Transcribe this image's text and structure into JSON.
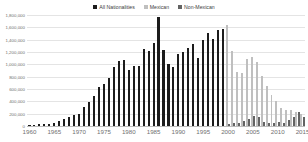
{
  "legend": {
    "position": "top-center",
    "items": [
      {
        "label": "All Nationalities",
        "color": "#1c1c1c",
        "icon": "square-marker-icon"
      },
      {
        "label": "Mexican",
        "color": "#bfbfbf",
        "icon": "square-marker-icon"
      },
      {
        "label": "Non-Mexican",
        "color": "#636363",
        "icon": "square-marker-icon"
      }
    ]
  },
  "axes": {
    "y_ticks": [
      "0",
      "200,000",
      "400,000",
      "600,000",
      "800,000",
      "1,000,000",
      "1,200,000",
      "1,400,000",
      "1,600,000",
      "1,800,000"
    ],
    "x_ticks": [
      "1960",
      "1965",
      "1970",
      "1975",
      "1980",
      "1985",
      "1990",
      "1995",
      "2000",
      "2005",
      "2010",
      "2015"
    ]
  },
  "chart_data": {
    "type": "bar",
    "title": "",
    "subtitle": "",
    "xlabel": "",
    "ylabel": "",
    "ylim": [
      0,
      1800000
    ],
    "ytick_step": 200000,
    "grid": true,
    "legend_position": "top-center",
    "x": [
      1960,
      1961,
      1962,
      1963,
      1964,
      1965,
      1966,
      1967,
      1968,
      1969,
      1970,
      1971,
      1972,
      1973,
      1974,
      1975,
      1976,
      1977,
      1978,
      1979,
      1980,
      1981,
      1982,
      1983,
      1984,
      1985,
      1986,
      1987,
      1988,
      1989,
      1990,
      1991,
      1992,
      1993,
      1994,
      1995,
      1996,
      1997,
      1998,
      1999,
      2000,
      2001,
      2002,
      2003,
      2004,
      2005,
      2006,
      2007,
      2008,
      2009,
      2010,
      2011,
      2012,
      2013,
      2014,
      2015
    ],
    "series": [
      {
        "name": "All Nationalities",
        "color": "#1c1c1c",
        "values": [
          21000,
          24000,
          27000,
          31000,
          34000,
          55000,
          80000,
          108000,
          152000,
          172000,
          201000,
          302000,
          396000,
          480000,
          634000,
          680000,
          781000,
          954000,
          1048000,
          1069000,
          910000,
          976000,
          971000,
          1252000,
          1215000,
          1350000,
          1767000,
          1232000,
          1009000,
          954000,
          1170000,
          1198000,
          1259000,
          1327000,
          1095000,
          1394000,
          1507000,
          1412000,
          1555000,
          1579000,
          null,
          null,
          null,
          null,
          null,
          null,
          null,
          null,
          null,
          null,
          null,
          null,
          null,
          null,
          null,
          null
        ]
      },
      {
        "name": "Mexican",
        "color": "#bfbfbf",
        "values": [
          null,
          null,
          null,
          null,
          null,
          null,
          null,
          null,
          null,
          null,
          null,
          null,
          null,
          null,
          null,
          null,
          null,
          null,
          null,
          null,
          null,
          null,
          null,
          null,
          null,
          null,
          null,
          null,
          null,
          null,
          null,
          null,
          null,
          null,
          null,
          null,
          null,
          null,
          null,
          null,
          1636000,
          1224000,
          879000,
          856000,
          1085000,
          1127000,
          1042000,
          809000,
          653000,
          503000,
          405000,
          287000,
          265000,
          266000,
          229000,
          188000
        ]
      },
      {
        "name": "Non-Mexican",
        "color": "#636363",
        "values": [
          null,
          null,
          null,
          null,
          null,
          null,
          null,
          null,
          null,
          null,
          null,
          null,
          null,
          null,
          null,
          null,
          null,
          null,
          null,
          null,
          null,
          null,
          null,
          null,
          null,
          null,
          null,
          null,
          null,
          null,
          null,
          null,
          null,
          null,
          null,
          null,
          null,
          null,
          null,
          null,
          38000,
          42000,
          50000,
          75000,
          112000,
          162000,
          145000,
          67000,
          52000,
          47000,
          59000,
          52000,
          100000,
          148000,
          229000,
          149000
        ]
      }
    ]
  }
}
